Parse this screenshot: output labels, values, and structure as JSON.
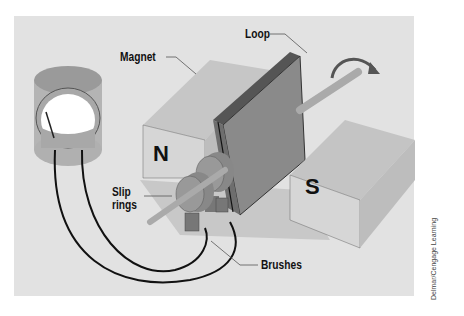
{
  "diagram": {
    "labels": {
      "magnet": "Magnet",
      "loop": "Loop",
      "slip_rings": "Slip\nrings",
      "slip_rings_line1": "Slip",
      "slip_rings_line2": "rings",
      "brushes": "Brushes"
    },
    "poles": {
      "north": "N",
      "south": "S"
    },
    "credit": "Delmar/Cengage Learning",
    "colors": {
      "background": "#e2e2e2",
      "magnet_front": "#d4d4d4",
      "magnet_top": "#c4c4c4",
      "loop": "#777777",
      "wire": "#111111"
    }
  }
}
